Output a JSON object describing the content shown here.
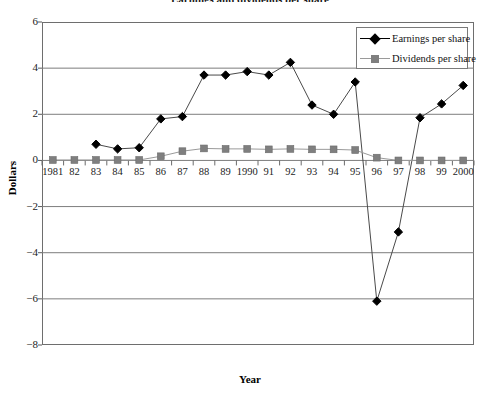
{
  "chart_data": {
    "type": "line",
    "title": "Earnings and dividends per share",
    "xlabel": "Year",
    "ylabel": "Dollars",
    "grid": true,
    "legend_position": "top-right",
    "ylim": [
      -8,
      6
    ],
    "yticks": [
      6,
      4,
      2,
      0,
      -2,
      -4,
      -6,
      -8
    ],
    "ytick_labels": [
      "6",
      "4",
      "2",
      "0",
      "−2",
      "−4",
      "−6",
      "−8"
    ],
    "categories": [
      "1981",
      "82",
      "83",
      "84",
      "85",
      "86",
      "87",
      "88",
      "89",
      "1990",
      "91",
      "92",
      "93",
      "94",
      "95",
      "96",
      "97",
      "98",
      "99",
      "2000"
    ],
    "series": [
      {
        "name": "Earnings per share",
        "color": "#000000",
        "marker": "diamond",
        "values": [
          null,
          null,
          0.7,
          0.5,
          0.55,
          1.8,
          1.9,
          3.7,
          3.7,
          3.85,
          3.7,
          4.25,
          2.4,
          2.0,
          3.4,
          -6.1,
          -3.1,
          1.85,
          2.45,
          3.25
        ]
      },
      {
        "name": "Dividends per share",
        "color": "#7f7f7f",
        "marker": "square",
        "values": [
          0.02,
          0.02,
          0.02,
          0.02,
          0.02,
          0.18,
          0.4,
          0.52,
          0.5,
          0.5,
          0.48,
          0.5,
          0.48,
          0.48,
          0.45,
          0.12,
          0.0,
          0.0,
          0.0,
          0.0
        ]
      }
    ]
  },
  "legend": {
    "items": [
      {
        "label": "Earnings per share"
      },
      {
        "label": "Dividends per share"
      }
    ]
  },
  "axes": {
    "y_title": "Dollars",
    "x_title": "Year"
  }
}
